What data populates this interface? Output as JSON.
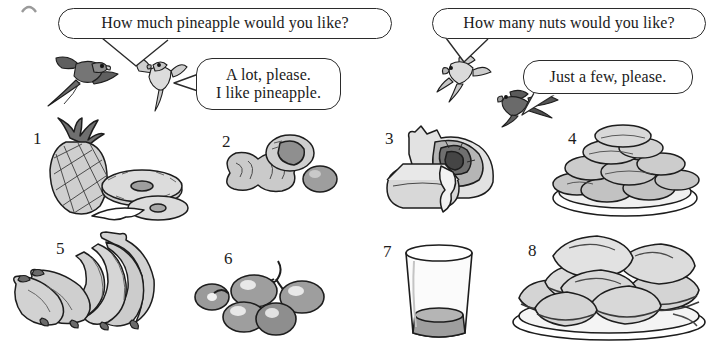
{
  "page": {
    "width": 714,
    "height": 344,
    "background": "#ffffff",
    "ink": "#1d1d1d",
    "fill_light": "#d6d6d6",
    "fill_mid": "#b3b3b3",
    "fill_dark": "#6e6e6e",
    "corner_mark": "partial-cropped-mark"
  },
  "dialogue": {
    "bubbles": [
      {
        "id": "q-pineapple",
        "name": "speech-bubble-how-much-pineapple",
        "text": "How much pineapple would you like?",
        "speaker": "dark-parrot-left",
        "x": 58,
        "y": 8,
        "w": 334,
        "h": 31,
        "font_size": 16
      },
      {
        "id": "a-pineapple",
        "name": "speech-bubble-a-lot-please",
        "text": "A lot, please.\nI like pineapple.",
        "speaker": "light-parrot-left",
        "x": 196,
        "y": 58,
        "w": 145,
        "h": 52,
        "font_size": 16
      },
      {
        "id": "q-nuts",
        "name": "speech-bubble-how-many-nuts",
        "text": "How many nuts would you like?",
        "speaker": "light-parrot-right",
        "x": 432,
        "y": 8,
        "w": 274,
        "h": 31,
        "font_size": 16
      },
      {
        "id": "a-nuts",
        "name": "speech-bubble-just-a-few-please",
        "text": "Just a few, please.",
        "speaker": "dark-parrot-right",
        "x": 523,
        "y": 60,
        "w": 170,
        "h": 34,
        "font_size": 16
      }
    ]
  },
  "birds": [
    {
      "id": "parrot-1",
      "name": "dark-parrot-flying-left",
      "shade": "dark",
      "x": 46,
      "y": 52,
      "w": 82,
      "h": 56,
      "flip": false
    },
    {
      "id": "parrot-2",
      "name": "light-parrot-flying-left",
      "shade": "light",
      "x": 131,
      "y": 57,
      "w": 58,
      "h": 56,
      "flip": true
    },
    {
      "id": "parrot-3",
      "name": "light-parrot-flying-right",
      "shade": "light",
      "x": 437,
      "y": 52,
      "w": 56,
      "h": 52,
      "flip": false
    },
    {
      "id": "parrot-4",
      "name": "dark-parrot-flying-right",
      "shade": "dark",
      "x": 494,
      "y": 88,
      "w": 66,
      "h": 40,
      "flip": true
    }
  ],
  "items": [
    {
      "number": "1",
      "name": "item-pineapple",
      "label": "pineapple",
      "num_x": 33,
      "num_y": 130,
      "art_x": 30,
      "art_y": 118,
      "art_w": 160,
      "art_h": 106
    },
    {
      "number": "2",
      "name": "item-peanuts",
      "label": "peanuts",
      "num_x": 222,
      "num_y": 133,
      "art_x": 210,
      "art_y": 133,
      "art_w": 128,
      "art_h": 80
    },
    {
      "number": "3",
      "name": "item-cake-slice",
      "label": "cake slice",
      "num_x": 385,
      "num_y": 130,
      "art_x": 383,
      "art_y": 124,
      "art_w": 130,
      "art_h": 92
    },
    {
      "number": "4",
      "name": "item-biscuits",
      "label": "biscuits",
      "num_x": 568,
      "num_y": 130,
      "art_x": 545,
      "art_y": 124,
      "art_w": 160,
      "art_h": 96
    },
    {
      "number": "5",
      "name": "item-bananas",
      "label": "bananas",
      "num_x": 56,
      "num_y": 240,
      "art_x": 6,
      "art_y": 230,
      "art_w": 172,
      "art_h": 110
    },
    {
      "number": "6",
      "name": "item-grapes",
      "label": "grapes",
      "num_x": 224,
      "num_y": 250,
      "art_x": 196,
      "art_y": 255,
      "art_w": 142,
      "art_h": 80
    },
    {
      "number": "7",
      "name": "item-glass",
      "label": "glass of juice",
      "num_x": 383,
      "num_y": 243,
      "art_x": 398,
      "art_y": 243,
      "art_w": 82,
      "art_h": 100
    },
    {
      "number": "8",
      "name": "item-sandwiches",
      "label": "sandwiches",
      "num_x": 528,
      "num_y": 242,
      "art_x": 505,
      "art_y": 230,
      "art_w": 206,
      "art_h": 112
    }
  ]
}
